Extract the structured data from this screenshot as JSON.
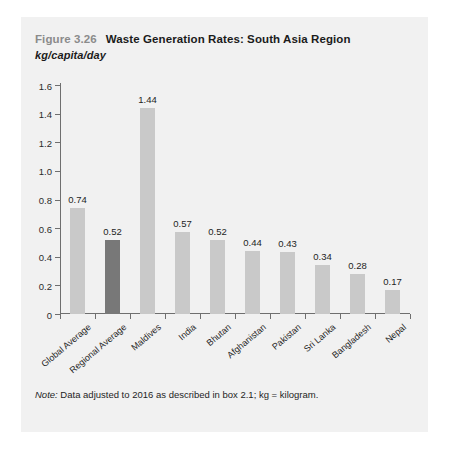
{
  "figure": {
    "number": "Figure 3.26",
    "title": "Waste Generation Rates: South Asia Region",
    "subtitle": "kg/capita/day",
    "note_label": "Note:",
    "note_text": " Data adjusted to 2016 as described in box 2.1; kg = kilogram."
  },
  "colors": {
    "panel_background": "#f1f1f1",
    "bar_default": "#c9c9c9",
    "bar_highlight": "#787878",
    "axis": "#6f6f6f",
    "figure_number": "#8b8b8b",
    "text": "#1e1e1e"
  },
  "chart_data": {
    "type": "bar",
    "title": "Waste Generation Rates: South Asia Region",
    "subtitle": "kg/capita/day",
    "xlabel": "",
    "ylabel": "kg/capita/day",
    "ylim": [
      0,
      1.6
    ],
    "yticks": [
      "0",
      "0.2",
      "0.4",
      "0.6",
      "0.8",
      "1.0",
      "1.2",
      "1.4",
      "1.6"
    ],
    "ytick_values": [
      0,
      0.2,
      0.4,
      0.6,
      0.8,
      1.0,
      1.2,
      1.4,
      1.6
    ],
    "grid": false,
    "legend": "none",
    "categories": [
      "Global Average",
      "Regional Average",
      "Maldives",
      "India",
      "Bhutan",
      "Afghanistan",
      "Pakistan",
      "Sri Lanka",
      "Bangladesh",
      "Nepal"
    ],
    "values": [
      0.74,
      0.52,
      1.44,
      0.57,
      0.52,
      0.44,
      0.43,
      0.34,
      0.28,
      0.17
    ],
    "value_labels": [
      "0.74",
      "0.52",
      "1.44",
      "0.57",
      "0.52",
      "0.44",
      "0.43",
      "0.34",
      "0.28",
      "0.17"
    ],
    "highlighted_index": 1
  }
}
